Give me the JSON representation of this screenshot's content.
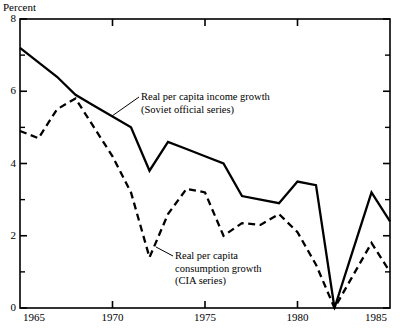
{
  "figure": {
    "y_axis_title": "Percent"
  },
  "chart_data": {
    "type": "line",
    "title": "",
    "xlabel": "",
    "ylabel": "Percent",
    "xlim": [
      1965,
      1985
    ],
    "ylim": [
      0,
      8
    ],
    "grid": false,
    "legend_position": "inline-annotations",
    "x_ticks": [
      "1965",
      "1970",
      "1975",
      "1980",
      "1985"
    ],
    "x_tick_values": [
      1965,
      1970,
      1975,
      1980,
      1985
    ],
    "y_ticks": [
      "0",
      "2",
      "4",
      "6",
      "8"
    ],
    "y_tick_values": [
      0,
      2,
      4,
      6,
      8
    ],
    "y_minor_tick_values": [
      1,
      3,
      5,
      7
    ],
    "x": [
      1965,
      1966,
      1967,
      1968,
      1969,
      1970,
      1971,
      1972,
      1973,
      1974,
      1975,
      1976,
      1977,
      1978,
      1979,
      1980,
      1981,
      1982,
      1983,
      1984,
      1985
    ],
    "series": [
      {
        "name": "Real per capita income growth (Soviet official series)",
        "style": "solid",
        "color": "#000000",
        "values": [
          7.2,
          6.8,
          6.4,
          5.9,
          5.6,
          5.3,
          5.0,
          3.8,
          4.6,
          4.4,
          4.2,
          4.0,
          3.1,
          3.0,
          2.9,
          3.5,
          3.4,
          0.0,
          1.6,
          3.2,
          2.4
        ]
      },
      {
        "name": "Real per capita consumption growth (CIA series)",
        "style": "dashed",
        "color": "#000000",
        "values": [
          4.9,
          4.7,
          5.5,
          5.8,
          5.0,
          4.2,
          3.2,
          1.4,
          2.6,
          3.3,
          3.2,
          2.0,
          2.35,
          2.3,
          2.6,
          2.1,
          1.2,
          0.0,
          0.9,
          1.8,
          1.0
        ]
      }
    ],
    "annotations": [
      {
        "id": "income-annotation",
        "lines": [
          "Real per capita income growth",
          "(Soviet official series)"
        ],
        "text_x": 141,
        "text_y": 91,
        "leader": {
          "x1": 139,
          "y1": 97,
          "x2": 112,
          "y2": 116
        }
      },
      {
        "id": "consumption-annotation",
        "lines": [
          "Real per capita",
          "consumption growth",
          "(CIA series)"
        ],
        "text_x": 175,
        "text_y": 250,
        "leader": {
          "x1": 173,
          "y1": 256,
          "x2": 156,
          "y2": 247
        }
      }
    ]
  }
}
